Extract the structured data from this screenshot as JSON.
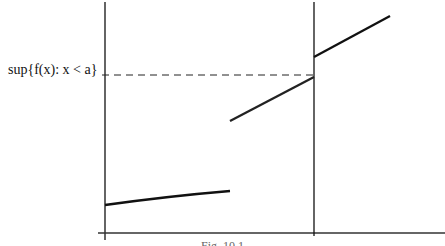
{
  "figure": {
    "label_sup": "sup{f(x): x < a}",
    "caption": "Fig. 10.1"
  },
  "geometry": {
    "y_axis_x": 105,
    "x_axis_y": 233,
    "a_line_x": 314,
    "dashed_y": 75
  },
  "segments": [
    {
      "name": "lower-curve",
      "from": [
        105,
        205
      ],
      "to": [
        230,
        191
      ]
    },
    {
      "name": "middle-line",
      "from": [
        230,
        121
      ],
      "to": [
        314,
        77
      ]
    },
    {
      "name": "upper-line",
      "from": [
        314,
        57
      ],
      "to": [
        390,
        16
      ]
    }
  ],
  "colors": {
    "line": "#111111"
  }
}
